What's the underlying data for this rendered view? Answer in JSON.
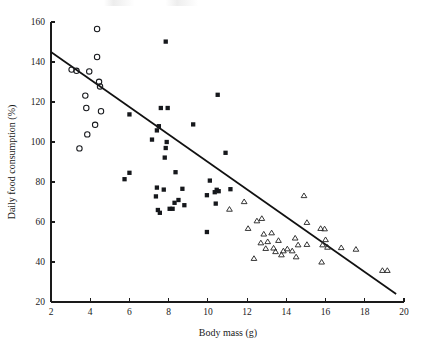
{
  "figure": {
    "background_color": "#ffffff",
    "ink_color": "#16181c",
    "top_partial_text": ""
  },
  "chart_data": {
    "type": "scatter",
    "title": "",
    "xlabel": "Body mass (g)",
    "ylabel": "Daily food consumption (%)",
    "xlim": [
      2,
      20
    ],
    "ylim": [
      20,
      160
    ],
    "xticks": [
      2,
      4,
      6,
      8,
      10,
      12,
      14,
      16,
      18,
      20
    ],
    "yticks": [
      20,
      40,
      60,
      80,
      100,
      120,
      140,
      160
    ],
    "xtick_labels": [
      "2",
      "4",
      "6",
      "8",
      "10",
      "12",
      "14",
      "16",
      "18",
      "20"
    ],
    "ytick_labels": [
      "20",
      "40",
      "60",
      "80",
      "100",
      "120",
      "140",
      "160"
    ],
    "grid": false,
    "legend": false,
    "legend_position": "none",
    "series": [
      {
        "name": "open-circle-group",
        "marker": "open-circle",
        "marker_size": 4.6,
        "color": "#16181c",
        "filled": false,
        "points": [
          [
            3.05,
            136.2
          ],
          [
            3.3,
            135.6
          ],
          [
            3.45,
            96.8
          ],
          [
            3.75,
            123.2
          ],
          [
            3.8,
            117.0
          ],
          [
            3.85,
            103.8
          ],
          [
            3.95,
            135.3
          ],
          [
            4.25,
            108.6
          ],
          [
            4.35,
            142.5
          ],
          [
            4.35,
            156.5
          ],
          [
            4.45,
            130.1
          ],
          [
            4.5,
            127.8
          ],
          [
            4.55,
            115.4
          ]
        ]
      },
      {
        "name": "filled-square-group",
        "marker": "filled-square",
        "marker_size": 4.3,
        "color": "#16181c",
        "filled": true,
        "points": [
          [
            5.75,
            81.4
          ],
          [
            6.0,
            84.6
          ],
          [
            6.0,
            113.8
          ],
          [
            7.15,
            101.2
          ],
          [
            7.35,
            72.8
          ],
          [
            7.4,
            77.2
          ],
          [
            7.4,
            105.8
          ],
          [
            7.45,
            66.0
          ],
          [
            7.5,
            107.9
          ],
          [
            7.55,
            64.6
          ],
          [
            7.6,
            117.0
          ],
          [
            7.75,
            76.2
          ],
          [
            7.8,
            92.2
          ],
          [
            7.85,
            97.0
          ],
          [
            7.85,
            150.2
          ],
          [
            7.9,
            100.0
          ],
          [
            7.95,
            117.0
          ],
          [
            8.05,
            66.6
          ],
          [
            8.2,
            66.6
          ],
          [
            8.3,
            69.6
          ],
          [
            8.35,
            84.9
          ],
          [
            8.5,
            71.0
          ],
          [
            8.7,
            76.6
          ],
          [
            8.8,
            68.4
          ],
          [
            9.25,
            108.8
          ],
          [
            9.95,
            55.0
          ],
          [
            9.95,
            73.4
          ],
          [
            10.1,
            80.7
          ],
          [
            10.35,
            74.9
          ],
          [
            10.4,
            69.2
          ],
          [
            10.45,
            76.1
          ],
          [
            10.5,
            123.6
          ],
          [
            10.55,
            75.4
          ],
          [
            10.9,
            94.6
          ],
          [
            11.15,
            76.4
          ]
        ]
      },
      {
        "name": "open-triangle-group",
        "marker": "open-triangle",
        "marker_size": 4.6,
        "color": "#2b2b2b",
        "filled": false,
        "points": [
          [
            11.1,
            66.4
          ],
          [
            11.85,
            70.2
          ],
          [
            12.05,
            56.8
          ],
          [
            12.35,
            41.8
          ],
          [
            12.5,
            60.6
          ],
          [
            12.7,
            49.6
          ],
          [
            12.75,
            61.8
          ],
          [
            12.85,
            54.0
          ],
          [
            12.95,
            46.8
          ],
          [
            13.05,
            50.2
          ],
          [
            13.25,
            54.6
          ],
          [
            13.35,
            47.0
          ],
          [
            13.45,
            45.2
          ],
          [
            13.6,
            50.8
          ],
          [
            13.75,
            43.6
          ],
          [
            13.85,
            45.6
          ],
          [
            14.05,
            46.6
          ],
          [
            14.3,
            45.6
          ],
          [
            14.45,
            52.0
          ],
          [
            14.5,
            42.6
          ],
          [
            14.6,
            48.6
          ],
          [
            14.9,
            73.2
          ],
          [
            15.05,
            59.8
          ],
          [
            15.05,
            48.8
          ],
          [
            15.75,
            56.8
          ],
          [
            15.8,
            40.0
          ],
          [
            15.85,
            48.6
          ],
          [
            15.95,
            56.6
          ],
          [
            16.0,
            51.2
          ],
          [
            16.1,
            47.4
          ],
          [
            16.8,
            47.2
          ],
          [
            17.55,
            46.4
          ],
          [
            18.9,
            35.8
          ],
          [
            19.15,
            35.8
          ]
        ]
      }
    ],
    "trend_line": {
      "name": "regression-line",
      "x_start": 2.0,
      "y_start": 145.0,
      "x_end": 19.6,
      "y_end": 24.0,
      "color": "#111111"
    }
  }
}
